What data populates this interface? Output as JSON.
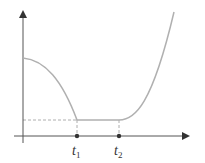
{
  "diagram": {
    "type": "piecewise-function-plot",
    "axes": {
      "x_arrow": true,
      "y_arrow": true
    },
    "curve_color": "#b0b0b0",
    "axis_color": "#444444",
    "markers": [
      {
        "name": "t1",
        "base": "t",
        "sub": "1"
      },
      {
        "name": "t2",
        "base": "t",
        "sub": "2"
      }
    ],
    "segments": [
      {
        "shape": "concave-decreasing",
        "from": "y-axis",
        "to": "t1"
      },
      {
        "shape": "constant",
        "from": "t1",
        "to": "t2"
      },
      {
        "shape": "convex-increasing",
        "from": "t2",
        "to": "right-edge"
      }
    ]
  }
}
